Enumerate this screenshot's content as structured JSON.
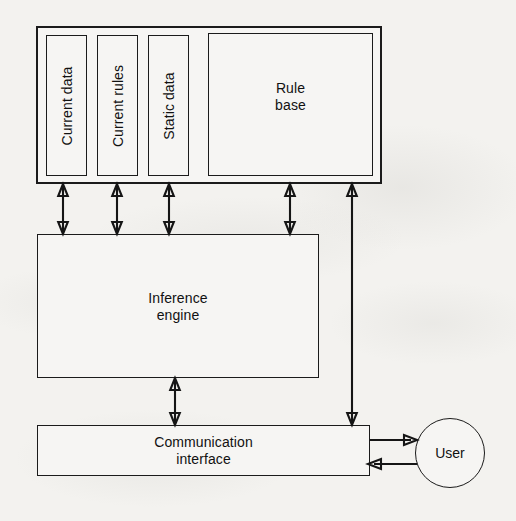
{
  "diagram": {
    "background_color": "#f3f2ef",
    "line_color": "#151515",
    "box_fill_color": "#f6f5f3",
    "nodes": {
      "outer_container": {
        "label": ""
      },
      "current_data": {
        "label": "Current data",
        "orientation": "vertical"
      },
      "current_rules": {
        "label": "Current rules",
        "orientation": "vertical"
      },
      "static_data": {
        "label": "Static data",
        "orientation": "vertical"
      },
      "rule_base": {
        "label": "Rule\nbase",
        "orientation": "horizontal"
      },
      "inference_engine": {
        "label": "Inference\nengine",
        "orientation": "horizontal"
      },
      "communication_interface": {
        "label": "Communication\ninterface",
        "orientation": "horizontal"
      },
      "user": {
        "label": "User",
        "shape": "circle"
      }
    },
    "connectors": [
      {
        "from": "current_data",
        "to": "inference_engine",
        "style": "double-arrow"
      },
      {
        "from": "current_rules",
        "to": "inference_engine",
        "style": "double-arrow"
      },
      {
        "from": "static_data",
        "to": "inference_engine",
        "style": "double-arrow"
      },
      {
        "from": "rule_base",
        "to": "inference_engine",
        "style": "double-arrow"
      },
      {
        "from": "outer_container",
        "to": "communication_interface",
        "style": "double-arrow"
      },
      {
        "from": "inference_engine",
        "to": "communication_interface",
        "style": "double-arrow"
      },
      {
        "from": "communication_interface",
        "to": "user",
        "style": "single-arrow"
      },
      {
        "from": "user",
        "to": "communication_interface",
        "style": "single-arrow"
      }
    ]
  }
}
